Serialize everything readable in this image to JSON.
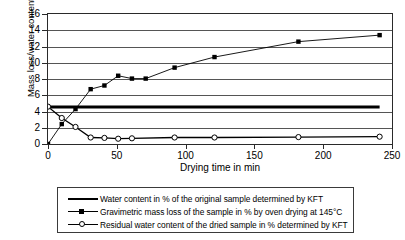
{
  "chart_data": {
    "type": "line",
    "title": "",
    "xlabel": "Drying time in min",
    "ylabel": "Mass loss/water content in %",
    "xlim": [
      0,
      250
    ],
    "ylim": [
      0,
      16
    ],
    "xticks": [
      0,
      50,
      100,
      150,
      200,
      250
    ],
    "yticks": [
      0,
      2,
      4,
      6,
      8,
      10,
      12,
      14,
      16
    ],
    "grid": true,
    "legend_position": "below-plot",
    "series": [
      {
        "name": "Water content in % of the original sample determined by KFT",
        "key": "water-content-reference",
        "style": "thick-solid-line-no-markers",
        "marker": "none",
        "color": "#000000",
        "constant_value": 4.55,
        "x": [
          0,
          241
        ],
        "y": [
          4.55,
          4.55
        ]
      },
      {
        "name": "Gravimetric mass loss of the sample in % by oven drying at 145°C",
        "key": "gravimetric-mass-loss",
        "style": "line-with-filled-square-markers",
        "marker": "filled-square",
        "color": "#000000",
        "x": [
          0,
          10,
          20,
          31,
          41,
          51,
          61,
          71,
          92,
          121,
          182,
          241
        ],
        "y": [
          0.0,
          2.45,
          4.3,
          6.75,
          7.2,
          8.4,
          8.05,
          8.05,
          9.4,
          10.7,
          12.6,
          13.4
        ]
      },
      {
        "name": "Residual water content of the dried sample in % determined by KFT",
        "key": "residual-water-content",
        "style": "line-with-open-circle-markers",
        "marker": "open-circle",
        "color": "#000000",
        "x": [
          0,
          10,
          20,
          31,
          41,
          51,
          61,
          92,
          121,
          182,
          241
        ],
        "y": [
          4.6,
          3.2,
          2.1,
          0.8,
          0.75,
          0.65,
          0.7,
          0.8,
          0.8,
          0.85,
          0.9
        ]
      }
    ]
  },
  "axes": {
    "y_title": "Mass loss/water content in %",
    "x_title": "Drying time in min",
    "y_tick_labels": [
      "0",
      "2",
      "4",
      "6",
      "8",
      "10",
      "12",
      "14",
      "16"
    ],
    "x_tick_labels": [
      "0",
      "50",
      "100",
      "150",
      "200",
      "250"
    ]
  },
  "legend": {
    "entries": [
      {
        "label": "Water content in % of the original sample determined by KFT",
        "marker": "none"
      },
      {
        "label": "Gravimetric mass loss of the sample in % by oven drying at 145°C",
        "marker": "filled-square"
      },
      {
        "label": "Residual water content of the dried sample in % determined by KFT",
        "marker": "open-circle"
      }
    ]
  },
  "colors": {
    "ink": "#000000",
    "grid": "#555555",
    "frame": "#2a2a2a",
    "background": "#ffffff"
  }
}
